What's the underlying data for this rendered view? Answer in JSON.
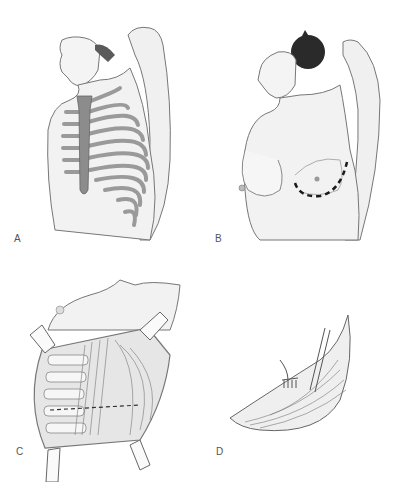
{
  "figure": {
    "panels": [
      {
        "id": "A",
        "label": "A",
        "description": "Lateral view of upper torso with arm raised, showing rib cage and sternum"
      },
      {
        "id": "B",
        "label": "B",
        "description": "Lateral view of female torso with arm raised, dashed inframammary incision line"
      },
      {
        "id": "C",
        "label": "C",
        "description": "Opened chest wall with retractors exposing ribs and muscles, dashed line"
      },
      {
        "id": "D",
        "label": "D",
        "description": "Crescent-shaped tissue flap with instruments (forceps and rake retractor)"
      }
    ]
  },
  "colors": {
    "background": "#ffffff",
    "skin": "#f2f2f2",
    "outline": "#6e6e6e",
    "bone": "#a8a8a8",
    "sternum": "#8c8c8c",
    "hair": "#2a2a2a",
    "incision": "#1a1a1a"
  }
}
